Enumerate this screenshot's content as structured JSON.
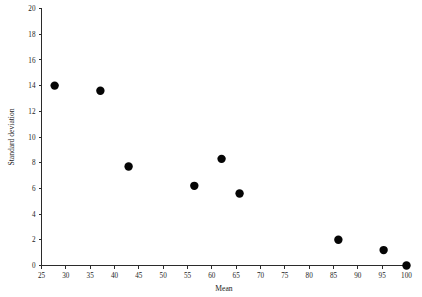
{
  "chart_data": {
    "type": "scatter",
    "title": "",
    "xlabel": "Mean",
    "ylabel": "Standard deviation",
    "xlim": [
      25,
      100
    ],
    "ylim": [
      0,
      20
    ],
    "xticks": [
      25,
      30,
      35,
      40,
      45,
      50,
      55,
      60,
      65,
      70,
      75,
      80,
      85,
      90,
      95,
      100
    ],
    "yticks": [
      0,
      2,
      4,
      6,
      8,
      10,
      12,
      14,
      16,
      18,
      20
    ],
    "xtick_labels": [
      "25",
      "30",
      "35",
      "40",
      "45",
      "50",
      "55",
      "60",
      "65",
      "70",
      "75",
      "80",
      "85",
      "90",
      "95",
      "100"
    ],
    "ytick_labels": [
      "0",
      "2",
      "4",
      "6",
      "8",
      "10",
      "12",
      "14",
      "16",
      "18",
      "20"
    ],
    "grid": false,
    "legend": "none",
    "marker": "filled-circle",
    "marker_color": "#050505",
    "marker_size": 4.2,
    "points": [
      {
        "x": 27.7,
        "y": 14.0
      },
      {
        "x": 37.1,
        "y": 13.6
      },
      {
        "x": 42.9,
        "y": 7.7
      },
      {
        "x": 56.4,
        "y": 6.2
      },
      {
        "x": 62.0,
        "y": 8.3
      },
      {
        "x": 65.7,
        "y": 5.6
      },
      {
        "x": 86.0,
        "y": 2.0
      },
      {
        "x": 95.3,
        "y": 1.2
      },
      {
        "x": 100.0,
        "y": 0.0
      }
    ]
  },
  "figure": {
    "background_color": "#ffffff",
    "axis_color": "#2b2b2b"
  }
}
